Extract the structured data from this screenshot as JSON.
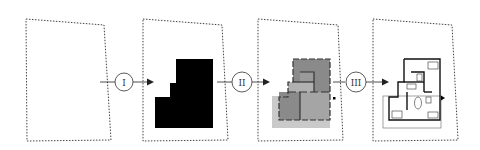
{
  "diagram": {
    "stages": [
      {
        "id": "boundary",
        "name": "Site boundary"
      },
      {
        "id": "footprint",
        "name": "Building footprint"
      },
      {
        "id": "rooms",
        "name": "Room partition"
      },
      {
        "id": "plan",
        "name": "Furnished floor plan"
      }
    ],
    "steps": [
      {
        "label": "I",
        "from": "boundary",
        "to": "footprint"
      },
      {
        "label": "II",
        "from": "footprint",
        "to": "rooms"
      },
      {
        "label": "III",
        "from": "rooms",
        "to": "plan"
      }
    ],
    "colors": {
      "boundary": "#444444",
      "footprint": "#000000",
      "room_dark": "#8a8a8a",
      "room_light": "#b4b4b4",
      "room_lighter": "#c9c9c9",
      "wall": "#222222",
      "arrow": "#222222"
    }
  }
}
